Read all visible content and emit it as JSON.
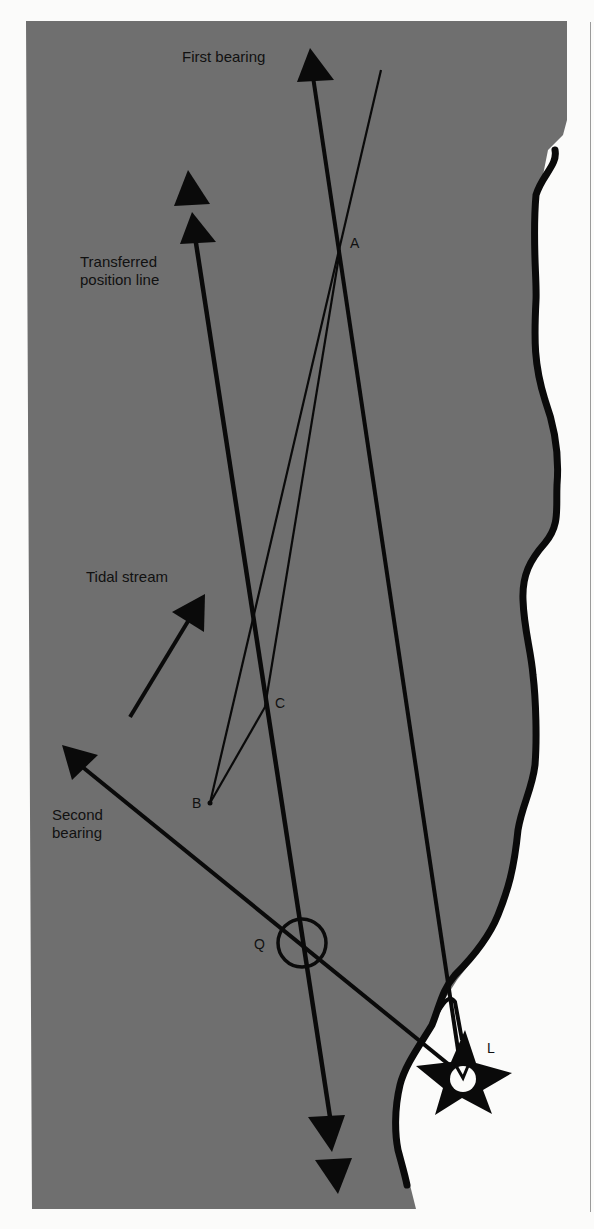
{
  "figure": {
    "colors": {
      "sea": "#6f6f6f",
      "land": "#fbfbfa",
      "ink": "#0a0a0a",
      "label": "#111111"
    }
  },
  "labels": {
    "first_bearing": "First bearing",
    "transferred_line_1": "Transferred",
    "transferred_line_2": "position line",
    "tidal_stream": "Tidal stream",
    "second_bearing_1": "Second",
    "second_bearing_2": "bearing"
  },
  "points": {
    "A": "A",
    "B": "B",
    "C": "C",
    "Q": "Q",
    "L": "L"
  },
  "icons": {
    "lighthouse": "star-lighthouse-icon",
    "arrow": "triangle-arrowhead-icon"
  }
}
